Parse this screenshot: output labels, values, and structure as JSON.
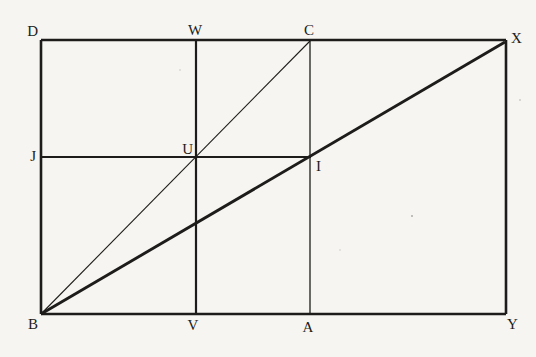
{
  "page": {
    "paper_color": "#f6f5f1",
    "ink_color": "#1d1c1a"
  },
  "figure": {
    "type": "geometry-diagram",
    "labels": {
      "D": "D",
      "W": "W",
      "C": "C",
      "X": "X",
      "J": "J",
      "U": "U",
      "I": "I",
      "B": "B",
      "V": "V",
      "A": "A",
      "Y": "Y"
    },
    "segments": [
      {
        "from": "D",
        "to": "X",
        "role": "rectangle-top-edge",
        "weight": "bold"
      },
      {
        "from": "D",
        "to": "B",
        "role": "rectangle-left-edge",
        "weight": "bold"
      },
      {
        "from": "B",
        "to": "Y",
        "role": "rectangle-bottom-edge",
        "weight": "bold"
      },
      {
        "from": "X",
        "to": "Y",
        "role": "rectangle-right-edge",
        "weight": "bold"
      },
      {
        "from": "W",
        "to": "V",
        "role": "vertical-through-U",
        "weight": "medium"
      },
      {
        "from": "C",
        "to": "A",
        "role": "vertical-through-I",
        "weight": "thin"
      },
      {
        "from": "J",
        "to": "I",
        "role": "horizontal-through-U",
        "weight": "medium"
      },
      {
        "from": "B",
        "to": "X",
        "role": "diagonal-through-I",
        "weight": "bold"
      },
      {
        "from": "B",
        "to": "C",
        "role": "diagonal-through-U",
        "weight": "thin"
      }
    ]
  }
}
